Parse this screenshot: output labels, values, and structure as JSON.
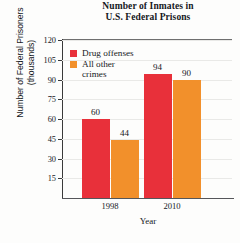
{
  "chart_data": {
    "type": "bar",
    "title": "Number of Inmates in U.S. Federal Prisons",
    "title_line1": "Number of Inmates in",
    "title_line2": "U.S. Federal Prisons",
    "xlabel": "Year",
    "ylabel": "Number of Federal Prisoners (thousands)",
    "ylabel_line1": "Number of Federal Prisoners",
    "ylabel_line2": "(thousands)",
    "categories": [
      "1998",
      "2010"
    ],
    "series": [
      {
        "name": "Drug offenses",
        "color": "#E8303A",
        "values": [
          60,
          94
        ]
      },
      {
        "name": "All other crimes",
        "color": "#F2902B",
        "values": [
          44,
          90
        ]
      }
    ],
    "ylim": [
      0,
      120
    ],
    "yticks": [
      15,
      30,
      45,
      60,
      75,
      90,
      105,
      120
    ],
    "ytick_labels": [
      "15",
      "30",
      "45",
      "60",
      "75",
      "90",
      "105",
      "120"
    ],
    "grid": "faint-horizontal",
    "legend_position": "upper-left-inside",
    "data_labels": [
      "60",
      "44",
      "94",
      "90"
    ],
    "legend": [
      {
        "label": "Drug offenses",
        "label_line1": "Drug offenses",
        "label_line2": ""
      },
      {
        "label": "All other crimes",
        "label_line1": "All other",
        "label_line2": "crimes"
      }
    ]
  }
}
